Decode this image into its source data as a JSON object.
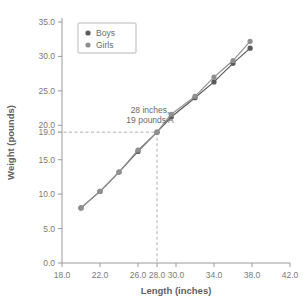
{
  "chart_data": {
    "type": "line",
    "title": "",
    "xlabel": "Length (inches)",
    "ylabel": "Weight (pounds)",
    "xlim": [
      18.0,
      42.0
    ],
    "ylim": [
      0.0,
      35.0
    ],
    "grid": false,
    "legend_position": "top-left",
    "xticks": [
      "18.0",
      "22.0",
      "26.0",
      "28.0",
      "30.0",
      "34.0",
      "38.0",
      "42.0"
    ],
    "xtick_values": [
      18.0,
      22.0,
      26.0,
      28.0,
      30.0,
      34.0,
      38.0,
      42.0
    ],
    "yticks": [
      "0.0",
      "5.0",
      "10.0",
      "15.0",
      "19.0",
      "20.0",
      "25.0",
      "30.0",
      "35.0"
    ],
    "ytick_values": [
      0.0,
      5.0,
      10.0,
      15.0,
      19.0,
      20.0,
      25.0,
      30.0,
      35.0
    ],
    "series": [
      {
        "name": "Boys",
        "color": "#5a5a5a",
        "x": [
          20.0,
          22.0,
          24.0,
          26.0,
          28.0,
          29.5,
          32.0,
          34.0,
          36.0,
          37.8
        ],
        "values": [
          8.0,
          10.4,
          13.2,
          16.2,
          19.0,
          21.2,
          24.0,
          26.3,
          29.0,
          31.2
        ]
      },
      {
        "name": "Girls",
        "color": "#8f8f8f",
        "x": [
          20.0,
          22.0,
          24.0,
          26.0,
          28.0,
          29.5,
          32.0,
          34.0,
          36.0,
          37.8
        ],
        "values": [
          8.0,
          10.4,
          13.2,
          16.4,
          19.0,
          21.6,
          24.2,
          27.0,
          29.4,
          32.2
        ]
      }
    ],
    "annotations": [
      {
        "id": "point-a",
        "line1": "28 inches,",
        "line2": "19 pounds A",
        "x": 28.0,
        "y": 19.0
      }
    ]
  },
  "legend": {
    "items": [
      {
        "label": "Boys",
        "color": "#5a5a5a"
      },
      {
        "label": "Girls",
        "color": "#8f8f8f"
      }
    ]
  }
}
